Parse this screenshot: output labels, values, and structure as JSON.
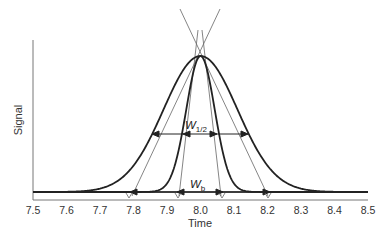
{
  "chart_data": {
    "type": "line",
    "title": "",
    "xlabel": "Time",
    "ylabel": "Signal",
    "xlim": [
      7.5,
      8.5
    ],
    "x_ticks": [
      "7.5",
      "7.6",
      "7.7",
      "7.8",
      "7.9",
      "8.0",
      "8.1",
      "8.2",
      "8.3",
      "8.4",
      "8.5"
    ],
    "y_ticks": [],
    "grid": false,
    "legend": null,
    "series": [
      {
        "name": "broad peak",
        "shape": "gaussian",
        "center": 8.0,
        "fwhm": 0.26,
        "base_width": 0.42,
        "height": 1.0
      },
      {
        "name": "narrow peak",
        "shape": "gaussian",
        "center": 8.0,
        "fwhm": 0.1,
        "base_width": 0.12,
        "height": 1.0
      }
    ],
    "annotations": [
      {
        "label": "W",
        "subscript": "1/2",
        "type": "width-at-half-height",
        "y_level": 0.5,
        "broad_span": [
          7.87,
          8.13
        ],
        "narrow_span": [
          7.95,
          8.05
        ]
      },
      {
        "label": "W",
        "subscript": "b",
        "type": "baseline-width",
        "y_level": 0.0,
        "broad_span": [
          7.79,
          8.21
        ],
        "narrow_span": [
          7.94,
          8.06
        ]
      },
      {
        "type": "tangent-lines",
        "description": "Inflection-point tangents of both peaks extended to intersect above apex and cross baseline"
      }
    ]
  },
  "labels": {
    "xlabel": "Time",
    "ylabel": "Signal",
    "w_half": "W",
    "w_half_sub": "1/2",
    "w_base": "W",
    "w_base_sub": "b"
  }
}
